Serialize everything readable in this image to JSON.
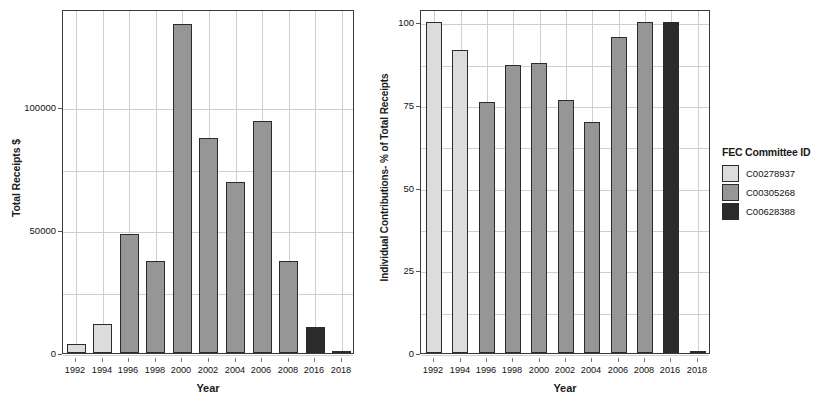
{
  "legend": {
    "title": "FEC Committee ID",
    "entries": [
      {
        "label": "C00278937",
        "color": "#dcdcdc"
      },
      {
        "label": "C00305268",
        "color": "#969696"
      },
      {
        "label": "C00628388",
        "color": "#2b2b2b"
      }
    ]
  },
  "colors": {
    "committee_1": "#dcdcdc",
    "committee_2": "#969696",
    "committee_3": "#2b2b2b",
    "bar_outline": "#2b2b2b",
    "grid": "#cfcfcf",
    "axis": "#3a3a3a",
    "background": "#ffffff"
  },
  "chart_data": [
    {
      "type": "bar",
      "title": "",
      "xlabel": "Year",
      "ylabel": "Total Receipts $",
      "categories": [
        "1992",
        "1994",
        "1996",
        "1998",
        "2000",
        "2002",
        "2004",
        "2006",
        "2008",
        "2016",
        "2018"
      ],
      "values": [
        3800,
        12000,
        48500,
        37500,
        134000,
        87500,
        69500,
        94500,
        37500,
        10500,
        0
      ],
      "series": [
        {
          "name": "Total Receipts $",
          "values": [
            3800,
            12000,
            48500,
            37500,
            134000,
            87500,
            69500,
            94500,
            37500,
            10500,
            0
          ]
        }
      ],
      "group_by_category": [
        "C00278937",
        "C00278937",
        "C00305268",
        "C00305268",
        "C00305268",
        "C00305268",
        "C00305268",
        "C00305268",
        "C00305268",
        "C00628388",
        "C00628388"
      ],
      "ylim": [
        0,
        140000
      ],
      "yticks": [
        0,
        50000,
        100000
      ],
      "ytick_labels": [
        "0",
        "50000",
        "100000"
      ],
      "grid": true,
      "legend_position": "right"
    },
    {
      "type": "bar",
      "title": "",
      "xlabel": "Year",
      "ylabel": "Individual Contributions- % of Total Receipts",
      "categories": [
        "1992",
        "1994",
        "1996",
        "1998",
        "2000",
        "2002",
        "2004",
        "2006",
        "2008",
        "2016",
        "2018"
      ],
      "values": [
        100,
        91.5,
        75.8,
        87.0,
        87.8,
        76.5,
        69.8,
        95.6,
        100,
        100,
        0
      ],
      "series": [
        {
          "name": "Individual Contributions- % of Total Receipts",
          "values": [
            100,
            91.5,
            75.8,
            87.0,
            87.8,
            76.5,
            69.8,
            95.6,
            100,
            100,
            0
          ]
        }
      ],
      "group_by_category": [
        "C00278937",
        "C00278937",
        "C00305268",
        "C00305268",
        "C00305268",
        "C00305268",
        "C00305268",
        "C00305268",
        "C00305268",
        "C00628388",
        "C00628388"
      ],
      "ylim": [
        0,
        104
      ],
      "yticks": [
        0,
        25,
        50,
        75,
        100
      ],
      "ytick_labels": [
        "0",
        "25",
        "50",
        "75",
        "100"
      ],
      "grid": true,
      "legend_position": "right"
    }
  ]
}
